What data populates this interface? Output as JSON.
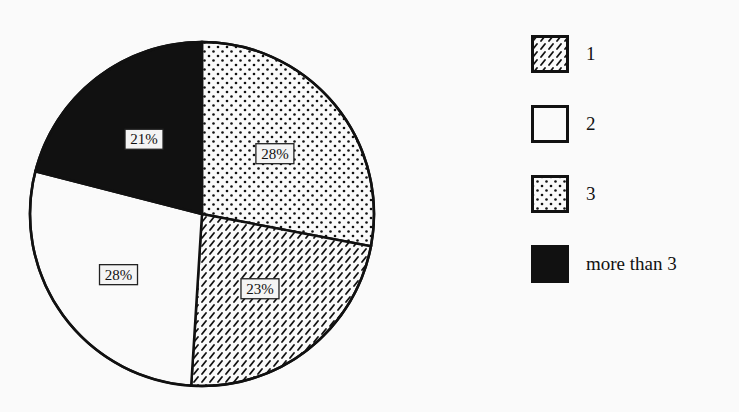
{
  "chart_data": {
    "type": "pie",
    "title": "",
    "categories": [
      "3",
      "1",
      "2",
      "more than 3"
    ],
    "values": [
      28,
      23,
      28,
      21
    ],
    "value_labels": [
      "28%",
      "23%",
      "28%",
      "21%"
    ],
    "start_angle": "12 o'clock",
    "direction": "clockwise",
    "fills": {
      "1": "diagonal-hatch",
      "2": "white",
      "3": "dots",
      "more than 3": "solid-black"
    },
    "legend_position": "right",
    "legend": [
      {
        "label": "1",
        "fill": "diagonal-hatch"
      },
      {
        "label": "2",
        "fill": "white"
      },
      {
        "label": "3",
        "fill": "dots"
      },
      {
        "label": "more than 3",
        "fill": "solid-black"
      }
    ]
  },
  "colors": {
    "ink": "#111111",
    "background": "#fafafa"
  }
}
